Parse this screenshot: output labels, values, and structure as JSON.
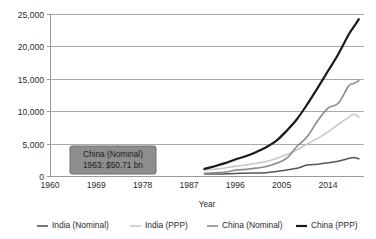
{
  "chart_data": {
    "type": "line",
    "title": "",
    "subtitle": "",
    "xlabel": "Year",
    "ylabel": "",
    "xlim": [
      1960,
      2021
    ],
    "ylim": [
      0,
      25000
    ],
    "grid": "horizontal",
    "legend_position": "bottom",
    "y_ticks": [
      0,
      5000,
      10000,
      15000,
      20000,
      25000
    ],
    "y_tick_labels": [
      "0",
      "5,000",
      "10,000",
      "15,000",
      "20,000",
      "25,000"
    ],
    "x_ticks": [
      1960,
      1969,
      1978,
      1987,
      1996,
      2005,
      2014
    ],
    "x_tick_labels": [
      "1960",
      "1969",
      "1978",
      "1987",
      "1996",
      "2005",
      "2014"
    ],
    "series": [
      {
        "name": "India (Nominal)",
        "color": "#555555",
        "width": 1.5,
        "x": [
          1990,
          1992,
          1994,
          1996,
          1998,
          2000,
          2002,
          2004,
          2006,
          2008,
          2010,
          2012,
          2014,
          2016,
          2018,
          2019,
          2020
        ],
        "values": [
          320,
          290,
          330,
          400,
          420,
          470,
          520,
          710,
          940,
          1200,
          1680,
          1830,
          2040,
          2290,
          2700,
          2870,
          2660
        ]
      },
      {
        "name": "India (PPP)",
        "color": "#c7c7c7",
        "width": 1.6,
        "x": [
          1990,
          1992,
          1994,
          1996,
          1998,
          2000,
          2002,
          2004,
          2006,
          2008,
          2010,
          2012,
          2014,
          2016,
          2018,
          2019,
          2020
        ],
        "values": [
          900,
          1060,
          1240,
          1480,
          1700,
          1960,
          2250,
          2700,
          3330,
          4030,
          4960,
          5800,
          6800,
          7970,
          9050,
          9540,
          9100
        ]
      },
      {
        "name": "China (Nominal)",
        "color": "#8a8a8a",
        "width": 1.6,
        "x": [
          1990,
          1992,
          1994,
          1996,
          1998,
          2000,
          2002,
          2004,
          2006,
          2008,
          2010,
          2012,
          2014,
          2016,
          2018,
          2019,
          2020
        ],
        "values": [
          400,
          500,
          580,
          880,
          1030,
          1210,
          1470,
          1960,
          2750,
          4590,
          6090,
          8530,
          10480,
          11230,
          13890,
          14280,
          14720
        ]
      },
      {
        "name": "China (PPP)",
        "color": "#1a1a1a",
        "width": 2.2,
        "x": [
          1990,
          1992,
          1994,
          1996,
          1998,
          2000,
          2002,
          2004,
          2006,
          2008,
          2010,
          2012,
          2014,
          2016,
          2018,
          2019,
          2020
        ],
        "values": [
          1100,
          1500,
          1980,
          2550,
          3050,
          3680,
          4430,
          5450,
          7000,
          8800,
          11100,
          13600,
          16200,
          18800,
          21800,
          23000,
          24200
        ]
      }
    ],
    "annotation": {
      "series_label": "China (Nominal)",
      "value_label": "1963: $50.71 bn",
      "year": 1963,
      "value": 50.71,
      "unit": "bn"
    }
  },
  "legend": {
    "items": [
      {
        "label": "India (Nominal)"
      },
      {
        "label": "India (PPP)"
      },
      {
        "label": "China (Nominal)"
      },
      {
        "label": "China (PPP)"
      }
    ]
  },
  "axis": {
    "x_title": "Year"
  }
}
